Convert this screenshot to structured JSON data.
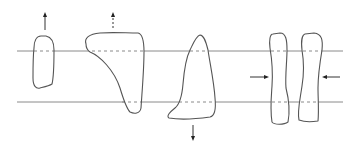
{
  "figure": {
    "colors": {
      "background": "#ffffff",
      "lines": "#8a8a8a",
      "outlines": "#555555",
      "arrows": "#222222"
    },
    "reference_lines": [
      {
        "name": "upper-line",
        "y": 51,
        "x_start": 17,
        "x_end": 343
      },
      {
        "name": "lower-line",
        "y": 102,
        "x_start": 17,
        "x_end": 343
      }
    ],
    "shapes": [
      {
        "name": "shape-1-small-oval",
        "arrow": "up"
      },
      {
        "name": "shape-2-inverted-triangle",
        "arrow": "up-dashed"
      },
      {
        "name": "shape-3-triangle",
        "arrow": "down"
      },
      {
        "name": "shape-4-pinched-column",
        "arrow": "left-pointing-right"
      },
      {
        "name": "shape-5-pinched-column",
        "arrow": "right-pointing-left"
      }
    ]
  }
}
